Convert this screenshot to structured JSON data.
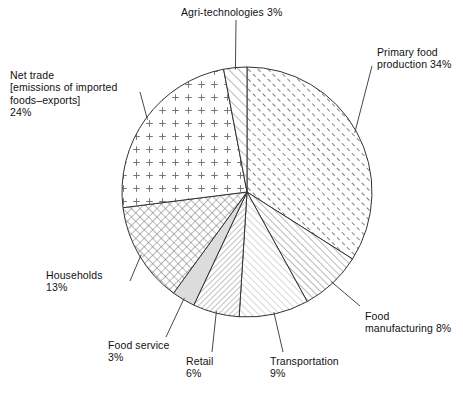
{
  "chart_data": {
    "type": "pie",
    "title": "",
    "subtitle": "",
    "xlabel": "",
    "ylabel": "",
    "units": "percent",
    "legend_position": "none",
    "labels_position": "outside-with-leader-lines",
    "grid": false,
    "start_angle_deg": 0,
    "direction": "clockwise",
    "total": 100,
    "categories": [
      "Primary food production",
      "Food manufacturing",
      "Transportation",
      "Retail",
      "Food service",
      "Households",
      "Net trade [emissions of imported foods–exports]",
      "Agri-technologies"
    ],
    "values": [
      34,
      8,
      9,
      6,
      3,
      13,
      24,
      3
    ],
    "slices": [
      {
        "id": "primary-food-production",
        "name": "Primary food production",
        "value": 34,
        "label": "Primary food\nproduction 34%",
        "value_text": "34%",
        "pattern": "diagonal-hatch-forward-dense",
        "fill": "#ffffff",
        "stroke": "#333333"
      },
      {
        "id": "food-manufacturing",
        "name": "Food manufacturing",
        "value": 8,
        "label": "Food\nmanufacturing 8%",
        "value_text": "8%",
        "pattern": "diagonal-hatch-forward-medium",
        "fill": "#ffffff",
        "stroke": "#333333"
      },
      {
        "id": "transportation",
        "name": "Transportation",
        "value": 9,
        "label": "Transportation\n9%",
        "value_text": "9%",
        "pattern": "diagonal-hatch-forward-light",
        "fill": "#ffffff",
        "stroke": "#333333"
      },
      {
        "id": "retail",
        "name": "Retail",
        "value": 6,
        "label": "Retail\n6%",
        "value_text": "6%",
        "pattern": "diagonal-hatch-backward-dense",
        "fill": "#ffffff",
        "stroke": "#333333"
      },
      {
        "id": "food-service",
        "name": "Food service",
        "value": 3,
        "label": "Food service\n3%",
        "value_text": "3%",
        "pattern": "solid-light-gray",
        "fill": "#dcdcdc",
        "stroke": "#333333"
      },
      {
        "id": "households",
        "name": "Households",
        "value": 13,
        "label": "Households\n13%",
        "value_text": "13%",
        "pattern": "crosshatch-diagonal",
        "fill": "#ffffff",
        "stroke": "#333333"
      },
      {
        "id": "net-trade",
        "name": "Net trade [emissions of imported foods–exports]",
        "value": 24,
        "label": "Net trade\n[emissions of imported\nfoods–exports]\n24%",
        "value_text": "24%",
        "pattern": "plus-marks",
        "fill": "#ffffff",
        "stroke": "#333333"
      },
      {
        "id": "agri-technologies",
        "name": "Agri-technologies",
        "value": 3,
        "label": "Agri-technologies 3%",
        "value_text": "3%",
        "pattern": "diagonal-hatch-forward-wide",
        "fill": "#ffffff",
        "stroke": "#333333"
      }
    ],
    "colors": {
      "outline": "#333333",
      "text": "#111111",
      "background": "#ffffff",
      "food_service_fill": "#dcdcdc"
    }
  }
}
